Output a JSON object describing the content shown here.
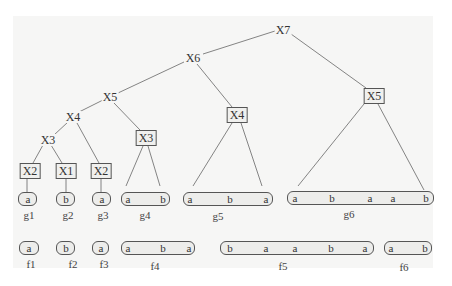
{
  "tree": {
    "internal_nodes": [
      {
        "id": "n-x7",
        "label": "X7",
        "x": 283,
        "y": 30,
        "boxed": false
      },
      {
        "id": "n-x6",
        "label": "X6",
        "x": 193,
        "y": 58,
        "boxed": false
      },
      {
        "id": "n-x5",
        "label": "X5",
        "x": 110,
        "y": 97,
        "boxed": false
      },
      {
        "id": "n-x4",
        "label": "X4",
        "x": 73,
        "y": 117,
        "boxed": false
      },
      {
        "id": "n-x3",
        "label": "X3",
        "x": 48,
        "y": 140,
        "boxed": false
      },
      {
        "id": "b-x3",
        "label": "X3",
        "x": 146,
        "y": 138,
        "boxed": true
      },
      {
        "id": "b-x4",
        "label": "X4",
        "x": 237,
        "y": 115,
        "boxed": true
      },
      {
        "id": "b-x5",
        "label": "X5",
        "x": 374,
        "y": 96,
        "boxed": true
      },
      {
        "id": "b-x2a",
        "label": "X2",
        "x": 30,
        "y": 171,
        "boxed": true
      },
      {
        "id": "b-x1",
        "label": "X1",
        "x": 66,
        "y": 171,
        "boxed": true
      },
      {
        "id": "b-x2b",
        "label": "X2",
        "x": 101,
        "y": 171,
        "boxed": true
      }
    ],
    "g_row": [
      {
        "name": "g1",
        "x": 20,
        "w": 20,
        "symbols": [
          "a"
        ]
      },
      {
        "name": "g2",
        "x": 56,
        "w": 20,
        "symbols": [
          "b"
        ]
      },
      {
        "name": "g3",
        "x": 92,
        "w": 19,
        "symbols": [
          "a"
        ]
      },
      {
        "name": "g4",
        "x": 121,
        "w": 49,
        "symbols": [
          "a",
          "b"
        ]
      },
      {
        "name": "g5",
        "x": 183,
        "w": 90,
        "symbols": [
          "a",
          "b",
          "a"
        ]
      },
      {
        "name": "g6",
        "x": 287,
        "w": 147,
        "symbols": [
          "a",
          "b",
          "a",
          "a",
          "b"
        ]
      }
    ],
    "f_row": [
      {
        "name": "f1",
        "x": 20,
        "w": 20,
        "symbols": [
          "a"
        ]
      },
      {
        "name": "f2",
        "x": 56,
        "w": 20,
        "symbols": [
          "b"
        ]
      },
      {
        "name": "f3",
        "x": 92,
        "w": 19,
        "symbols": [
          "a"
        ]
      },
      {
        "name": "f4",
        "x": 121,
        "w": 74,
        "symbols": [
          "a",
          "b",
          "a"
        ]
      },
      {
        "name": "f5",
        "x": 220,
        "w": 154,
        "symbols": [
          "b",
          "a",
          "a",
          "b",
          "a"
        ]
      },
      {
        "name": "f6",
        "x": 384,
        "w": 48,
        "symbols": [
          "a",
          "b"
        ]
      }
    ]
  },
  "labels": {
    "x7": "X7",
    "x6": "X6",
    "x5": "X5",
    "x4": "X4",
    "x3": "X3",
    "box_x3": "X3",
    "box_x4": "X4",
    "box_x5": "X5",
    "box_x2a": "X2",
    "box_x1": "X1",
    "box_x2b": "X2",
    "g1": "g1",
    "g2": "g2",
    "g3": "g3",
    "g4": "g4",
    "g5": "g5",
    "g6": "g6",
    "f1": "f1",
    "f2": "f2",
    "f3": "f3",
    "f4": "f4",
    "f5": "f5",
    "f6": "f6",
    "g1_s": [
      "a"
    ],
    "g2_s": [
      "b"
    ],
    "g3_s": [
      "a"
    ],
    "g4_s": [
      "a",
      "b"
    ],
    "g5_s": [
      "a",
      "b",
      "a"
    ],
    "g6_s": [
      "a",
      "b",
      "a",
      "a",
      "b"
    ],
    "f1_s": [
      "a"
    ],
    "f2_s": [
      "b"
    ],
    "f3_s": [
      "a"
    ],
    "f4_s": [
      "a",
      "b",
      "a"
    ],
    "f5_s": [
      "b",
      "a",
      "a",
      "b",
      "a"
    ],
    "f6_s": [
      "a",
      "b"
    ]
  },
  "colors": {
    "panel_bg": "#f6f6f5",
    "line": "#555555",
    "pill_fill": "#ededeb",
    "text": "#333333"
  }
}
